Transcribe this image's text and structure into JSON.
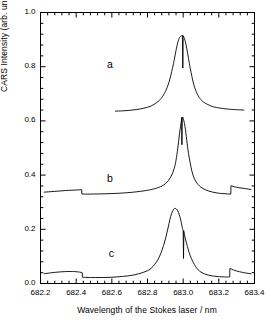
{
  "axes": {
    "xlabel": "Wavelength of the Stokes laser / nm",
    "ylabel": "CARS Intensity (arb. units)",
    "xticks": [
      "682.2",
      "682.4",
      "682.6",
      "682.8",
      "683.0",
      "683.2",
      "683.4"
    ],
    "yticks": [
      "0.0",
      "0.2",
      "0.4",
      "0.6",
      "0.8",
      "1.0"
    ]
  },
  "labels": {
    "a": "a",
    "b": "b",
    "c": "c"
  },
  "colors": {
    "axis": "#000000",
    "trace": "#000000",
    "background": "#ffffff"
  },
  "chart_data": {
    "type": "line",
    "title": "",
    "xlabel": "Wavelength of the Stokes laser / nm",
    "ylabel": "CARS Intensity (arb. units)",
    "xlim": [
      682.2,
      683.4
    ],
    "ylim": [
      0.0,
      1.0
    ],
    "xticks": [
      682.2,
      682.4,
      682.6,
      682.8,
      683.0,
      683.2,
      683.4
    ],
    "yticks": [
      0.0,
      0.2,
      0.4,
      0.6,
      0.8,
      1.0
    ],
    "grid": false,
    "legend": "inline-labels",
    "minor_ticks_per_interval": 4,
    "annotations": [
      {
        "text": "a",
        "x": 682.59,
        "y": 0.805
      },
      {
        "text": "b",
        "x": 682.59,
        "y": 0.385
      },
      {
        "text": "c",
        "x": 682.6,
        "y": 0.11
      }
    ],
    "series": [
      {
        "name": "a",
        "label": "a",
        "baseline": 0.635,
        "peak_center": 683.0,
        "peak_height": 0.915,
        "hwhm_nm": 0.052,
        "x_range": [
          682.62,
          683.34
        ],
        "narrow_dip": {
          "x": 682.998,
          "depth_to": 0.795,
          "width_nm": 0.004
        },
        "x": [
          682.62,
          682.66,
          682.7,
          682.74,
          682.78,
          682.82,
          682.86,
          682.88,
          682.9,
          682.92,
          682.94,
          682.95,
          682.96,
          682.97,
          682.98,
          682.99,
          682.995,
          683.0,
          683.005,
          683.01,
          683.02,
          683.03,
          683.04,
          683.06,
          683.08,
          683.1,
          683.12,
          683.16,
          683.2,
          683.26,
          683.34
        ],
        "y": [
          0.636,
          0.637,
          0.639,
          0.642,
          0.647,
          0.655,
          0.672,
          0.686,
          0.708,
          0.742,
          0.794,
          0.826,
          0.86,
          0.89,
          0.908,
          0.914,
          0.915,
          0.913,
          0.908,
          0.898,
          0.868,
          0.83,
          0.793,
          0.733,
          0.698,
          0.678,
          0.667,
          0.654,
          0.648,
          0.643,
          0.64
        ]
      },
      {
        "name": "b",
        "label": "b",
        "baseline_left": 0.338,
        "baseline_mid": 0.33,
        "peak_center": 682.995,
        "peak_height": 0.613,
        "hwhm_nm": 0.03,
        "x_range": [
          682.22,
          683.38
        ],
        "step_down": {
          "x": 682.432,
          "from": 0.345,
          "to": 0.33
        },
        "step_up": {
          "x": 683.268,
          "from": 0.33,
          "to": 0.36
        },
        "narrow_dip": {
          "x": 682.993,
          "depth_to": 0.512,
          "width_nm": 0.004
        },
        "x": [
          682.22,
          682.28,
          682.34,
          682.4,
          682.431,
          682.432,
          682.48,
          682.56,
          682.64,
          682.72,
          682.8,
          682.86,
          682.9,
          682.93,
          682.95,
          682.96,
          682.97,
          682.98,
          682.99,
          682.995,
          683.0,
          683.01,
          683.02,
          683.03,
          683.05,
          683.07,
          683.1,
          683.14,
          683.19,
          683.24,
          683.267,
          683.268,
          683.3,
          683.38
        ],
        "y": [
          0.337,
          0.34,
          0.343,
          0.345,
          0.346,
          0.33,
          0.33,
          0.331,
          0.333,
          0.337,
          0.344,
          0.354,
          0.368,
          0.392,
          0.425,
          0.455,
          0.5,
          0.555,
          0.6,
          0.613,
          0.61,
          0.58,
          0.53,
          0.48,
          0.412,
          0.378,
          0.355,
          0.342,
          0.334,
          0.331,
          0.33,
          0.361,
          0.355,
          0.347
        ]
      },
      {
        "name": "c",
        "label": "c",
        "baseline_left": 0.038,
        "baseline_mid": 0.024,
        "peak_center": 682.955,
        "peak_height": 0.277,
        "hwhm_nm": 0.055,
        "x_range": [
          682.22,
          683.38
        ],
        "bump": {
          "x": 682.39,
          "height": 0.044
        },
        "step_down": {
          "x": 682.435,
          "from": 0.04,
          "to": 0.023
        },
        "step_up": {
          "x": 683.262,
          "from": 0.024,
          "to": 0.055
        },
        "narrow_spike": {
          "x": 683.002,
          "from": 0.195,
          "to": 0.092,
          "width_nm": 0.004
        },
        "x": [
          682.22,
          682.28,
          682.34,
          682.39,
          682.42,
          682.434,
          682.435,
          682.48,
          682.54,
          682.6,
          682.66,
          682.72,
          682.78,
          682.82,
          682.86,
          682.89,
          682.91,
          682.93,
          682.945,
          682.955,
          682.97,
          682.985,
          682.995,
          683.0,
          683.005,
          683.01,
          683.02,
          683.04,
          683.07,
          683.1,
          683.14,
          683.19,
          683.24,
          683.261,
          683.262,
          683.29,
          683.34,
          683.38
        ],
        "y": [
          0.036,
          0.041,
          0.044,
          0.044,
          0.042,
          0.04,
          0.023,
          0.022,
          0.022,
          0.023,
          0.026,
          0.031,
          0.042,
          0.056,
          0.09,
          0.14,
          0.19,
          0.248,
          0.272,
          0.277,
          0.268,
          0.238,
          0.206,
          0.196,
          0.186,
          0.172,
          0.146,
          0.102,
          0.062,
          0.042,
          0.031,
          0.026,
          0.024,
          0.024,
          0.056,
          0.048,
          0.04,
          0.036
        ]
      }
    ]
  }
}
